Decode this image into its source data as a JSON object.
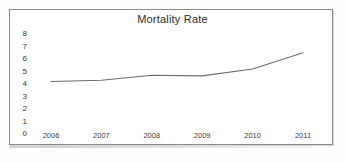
{
  "chart_data": {
    "type": "line",
    "title": "Mortality Rate",
    "xlabel": "",
    "ylabel": "",
    "categories": [
      "2006",
      "2007",
      "2008",
      "2009",
      "2010",
      "2011"
    ],
    "x": [
      2006,
      2007,
      2008,
      2009,
      2010,
      2011
    ],
    "values": [
      4.2,
      4.3,
      4.7,
      4.65,
      5.2,
      6.5
    ],
    "series": [
      {
        "name": "Mortality Rate",
        "values": [
          4.2,
          4.3,
          4.7,
          4.65,
          5.2,
          6.5
        ]
      }
    ],
    "ylim": [
      0,
      8
    ],
    "yticks": [
      8,
      7,
      6,
      5,
      4,
      3,
      2,
      1,
      0
    ],
    "ytick_labels": [
      "8",
      "7",
      "6",
      "5",
      "4",
      "3",
      "2",
      "1",
      "0"
    ],
    "xtick_labels": [
      "2006",
      "2007",
      "2008",
      "2009",
      "2010",
      "2011"
    ],
    "grid": false,
    "legend": "none",
    "line_color": "#6b6b6b",
    "background_color": "#ffffff",
    "border_color": "#8a8a8a",
    "text_color": "#3a3a3a"
  }
}
